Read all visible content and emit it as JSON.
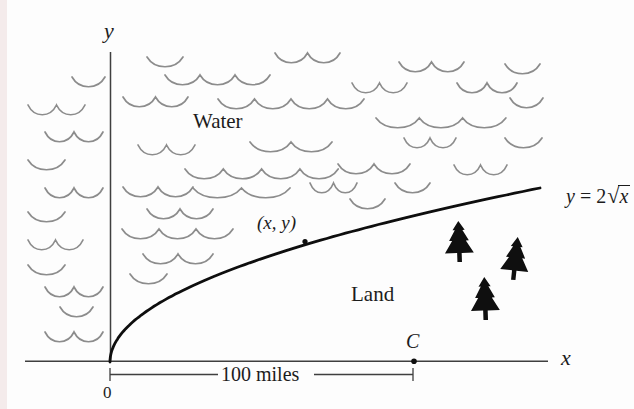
{
  "figure": {
    "width": 634,
    "height": 409,
    "background": "#fdfdfd",
    "scan_edge_color": "#f4ebeb",
    "ink_color": "#0e0e0e",
    "axis_color": "#3f3f3f",
    "wave_color": "#8c8c8c",
    "tree_color": "#0f0f0f"
  },
  "labels": {
    "y_axis": {
      "text": "y",
      "x": 104,
      "y": 20,
      "size": 22
    },
    "water": {
      "text": "Water",
      "x": 193,
      "y": 111,
      "size": 21
    },
    "point": {
      "text": "(x, y)",
      "x": 257,
      "y": 213,
      "size": 19
    },
    "land": {
      "text": "Land",
      "x": 351,
      "y": 284,
      "size": 21
    },
    "c_point": {
      "text": "C",
      "x": 406,
      "y": 331,
      "size": 20
    },
    "x_axis": {
      "text": "x",
      "x": 561,
      "y": 347,
      "size": 22
    },
    "distance": {
      "text": "100 miles",
      "x": 221,
      "y": 364,
      "size": 20
    },
    "origin": {
      "text": "0",
      "x": 103,
      "y": 384,
      "size": 17
    }
  },
  "equation": {
    "lhs": "y",
    "rel": "=",
    "coeff": "2",
    "radical": "√",
    "radicand": "x",
    "x": 546,
    "y": 165,
    "size": 20
  },
  "geometry": {
    "x_axis": {
      "x0": 25,
      "x1": 548,
      "y": 361.2
    },
    "y_axis": {
      "x": 110.5,
      "y0": 52,
      "y1": 361.5
    },
    "curve": {
      "x0": 110,
      "y0": 362,
      "x1": 540,
      "rise": 174
    },
    "curve_dot": {
      "x": 305,
      "y": 241.5,
      "r": 2.6
    },
    "c_dot": {
      "x": 414,
      "y": 361.2,
      "r": 2.8
    },
    "dimension": {
      "y": 374.5,
      "x0": 110,
      "x1": 413,
      "gap0": 218,
      "gap1": 314,
      "tick_top": 368,
      "tick_bottom": 381
    }
  },
  "waves": [
    {
      "x0": 72,
      "x1": 105,
      "y": 77,
      "arcs": 1
    },
    {
      "x0": 28,
      "x1": 85,
      "y": 105,
      "arcs": 2
    },
    {
      "x0": 45,
      "x1": 103,
      "y": 132,
      "arcs": 2
    },
    {
      "x0": 28,
      "x1": 65,
      "y": 160,
      "arcs": 1
    },
    {
      "x0": 45,
      "x1": 103,
      "y": 188,
      "arcs": 2
    },
    {
      "x0": 28,
      "x1": 65,
      "y": 212,
      "arcs": 1
    },
    {
      "x0": 28,
      "x1": 83,
      "y": 240,
      "arcs": 2
    },
    {
      "x0": 28,
      "x1": 65,
      "y": 265,
      "arcs": 1
    },
    {
      "x0": 45,
      "x1": 103,
      "y": 287,
      "arcs": 2
    },
    {
      "x0": 60,
      "x1": 93,
      "y": 307,
      "arcs": 1
    },
    {
      "x0": 45,
      "x1": 103,
      "y": 332,
      "arcs": 2
    },
    {
      "x0": 147,
      "x1": 183,
      "y": 57,
      "arcs": 1
    },
    {
      "x0": 165,
      "x1": 270,
      "y": 75,
      "arcs": 3
    },
    {
      "x0": 275,
      "x1": 340,
      "y": 53,
      "arcs": 2
    },
    {
      "x0": 399,
      "x1": 464,
      "y": 62,
      "arcs": 2
    },
    {
      "x0": 505,
      "x1": 540,
      "y": 64,
      "arcs": 1
    },
    {
      "x0": 123,
      "x1": 188,
      "y": 97,
      "arcs": 2
    },
    {
      "x0": 352,
      "x1": 407,
      "y": 83,
      "arcs": 2
    },
    {
      "x0": 457,
      "x1": 517,
      "y": 83,
      "arcs": 2
    },
    {
      "x0": 510,
      "x1": 543,
      "y": 98,
      "arcs": 1
    },
    {
      "x0": 218,
      "x1": 364,
      "y": 99,
      "arcs": 4
    },
    {
      "x0": 376,
      "x1": 506,
      "y": 118,
      "arcs": 3
    },
    {
      "x0": 138,
      "x1": 195,
      "y": 145,
      "arcs": 2
    },
    {
      "x0": 250,
      "x1": 332,
      "y": 142,
      "arcs": 2
    },
    {
      "x0": 404,
      "x1": 456,
      "y": 138,
      "arcs": 2
    },
    {
      "x0": 505,
      "x1": 542,
      "y": 138,
      "arcs": 1
    },
    {
      "x0": 185,
      "x1": 338,
      "y": 169,
      "arcs": 4
    },
    {
      "x0": 338,
      "x1": 410,
      "y": 164,
      "arcs": 2
    },
    {
      "x0": 454,
      "x1": 507,
      "y": 165,
      "arcs": 2
    },
    {
      "x0": 123,
      "x1": 193,
      "y": 187,
      "arcs": 2
    },
    {
      "x0": 193,
      "x1": 290,
      "y": 188,
      "arcs": 2
    },
    {
      "x0": 310,
      "x1": 357,
      "y": 183,
      "arcs": 2
    },
    {
      "x0": 395,
      "x1": 430,
      "y": 183,
      "arcs": 1
    },
    {
      "x0": 350,
      "x1": 385,
      "y": 199,
      "arcs": 1
    },
    {
      "x0": 147,
      "x1": 213,
      "y": 209,
      "arcs": 2
    },
    {
      "x0": 122,
      "x1": 233,
      "y": 229,
      "arcs": 3
    },
    {
      "x0": 143,
      "x1": 213,
      "y": 254,
      "arcs": 2
    },
    {
      "x0": 130,
      "x1": 167,
      "y": 274,
      "arcs": 1
    }
  ],
  "trees": [
    {
      "x": 440,
      "y": 221,
      "w": 38,
      "h": 41,
      "rot": -2
    },
    {
      "x": 497,
      "y": 237,
      "w": 37,
      "h": 43,
      "rot": 6
    },
    {
      "x": 466,
      "y": 277,
      "w": 38,
      "h": 43,
      "rot": -2
    }
  ]
}
